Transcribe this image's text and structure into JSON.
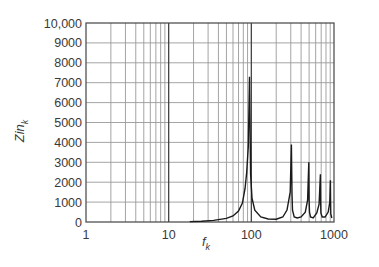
{
  "chart_data": {
    "type": "line",
    "title": "",
    "xlabel": "f_k",
    "ylabel": "Zin_k",
    "x_scale": "log",
    "xlim": [
      1,
      1000
    ],
    "ylim": [
      0,
      10000
    ],
    "grid": true,
    "legend": null,
    "x_ticks": [
      "1",
      "10",
      "100",
      "1000"
    ],
    "y_ticks": [
      "0",
      "1000",
      "2000",
      "3000",
      "4000",
      "5000",
      "6000",
      "7000",
      "8000",
      "9000",
      "10,000"
    ],
    "series": [
      {
        "name": "Zin_k",
        "x": [
          18,
          25,
          35,
          50,
          60,
          70,
          78,
          84,
          88,
          92,
          95,
          98,
          102,
          110,
          130,
          160,
          200,
          240,
          270,
          295,
          305,
          310,
          315,
          330,
          360,
          400,
          450,
          480,
          495,
          500,
          505,
          520,
          560,
          620,
          660,
          685,
          690,
          695,
          720,
          780,
          850,
          890,
          905,
          910,
          915,
          940
        ],
        "y": [
          20,
          40,
          80,
          180,
          300,
          550,
          950,
          1700,
          2500,
          3800,
          7300,
          2400,
          1200,
          600,
          250,
          150,
          140,
          250,
          600,
          1500,
          3900,
          1400,
          600,
          250,
          200,
          250,
          500,
          1100,
          3000,
          1100,
          500,
          250,
          200,
          450,
          900,
          2400,
          900,
          450,
          250,
          250,
          500,
          1000,
          2100,
          1000,
          400,
          200
        ]
      }
    ],
    "peaks": [
      {
        "f": 95,
        "zin": 7300
      },
      {
        "f": 310,
        "zin": 3900
      },
      {
        "f": 500,
        "zin": 3000
      },
      {
        "f": 690,
        "zin": 2450
      },
      {
        "f": 910,
        "zin": 2100
      }
    ]
  },
  "labels": {
    "xlabel_main": "f",
    "xlabel_sub": "k",
    "ylabel_main": "Zin",
    "ylabel_sub": "k"
  }
}
